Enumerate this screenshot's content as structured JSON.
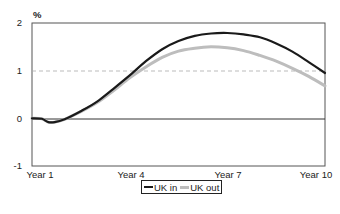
{
  "chart_data": {
    "type": "line",
    "title": "",
    "ylabel": "%",
    "xlabel": "",
    "ylim": [
      -1,
      2
    ],
    "yticks": [
      -1,
      0,
      1,
      2
    ],
    "x": [
      "Year 1",
      "Year 2",
      "Year 3",
      "Year 4",
      "Year 5",
      "Year 6",
      "Year 7",
      "Year 8",
      "Year 9",
      "Year 10"
    ],
    "xtick_labels": [
      "Year 1",
      "Year 4",
      "Year 7",
      "Year 10"
    ],
    "grid": {
      "dashed_reference_line_at": 1,
      "solid_zero_line": true
    },
    "legend_position": "bottom-center",
    "series": [
      {
        "name": "UK in",
        "color": "#1a1a1a",
        "width": 2.2,
        "values": [
          0.0,
          -0.02,
          0.35,
          0.9,
          1.45,
          1.73,
          1.79,
          1.7,
          1.4,
          0.95
        ]
      },
      {
        "name": "UK out",
        "color": "#bdbdbd",
        "width": 3.0,
        "values": [
          0.0,
          -0.02,
          0.33,
          0.85,
          1.28,
          1.47,
          1.48,
          1.32,
          1.05,
          0.68
        ]
      }
    ],
    "dense_curves": {
      "UK in": [
        [
          1,
          0
        ],
        [
          1.3,
          -0.01
        ],
        [
          1.5,
          -0.08
        ],
        [
          1.7,
          -0.08
        ],
        [
          2,
          -0.02
        ],
        [
          2.5,
          0.15
        ],
        [
          3,
          0.35
        ],
        [
          3.5,
          0.62
        ],
        [
          4,
          0.9
        ],
        [
          4.5,
          1.2
        ],
        [
          5,
          1.45
        ],
        [
          5.5,
          1.62
        ],
        [
          6,
          1.73
        ],
        [
          6.5,
          1.78
        ],
        [
          7,
          1.79
        ],
        [
          7.5,
          1.76
        ],
        [
          8,
          1.7
        ],
        [
          8.5,
          1.57
        ],
        [
          9,
          1.4
        ],
        [
          9.5,
          1.18
        ],
        [
          10,
          0.95
        ]
      ],
      "UK out": [
        [
          1,
          0
        ],
        [
          1.3,
          -0.01
        ],
        [
          1.5,
          -0.08
        ],
        [
          1.7,
          -0.08
        ],
        [
          2,
          -0.02
        ],
        [
          2.5,
          0.14
        ],
        [
          3,
          0.33
        ],
        [
          3.5,
          0.58
        ],
        [
          4,
          0.85
        ],
        [
          4.5,
          1.08
        ],
        [
          5,
          1.28
        ],
        [
          5.5,
          1.41
        ],
        [
          6,
          1.47
        ],
        [
          6.5,
          1.5
        ],
        [
          7,
          1.48
        ],
        [
          7.5,
          1.42
        ],
        [
          8,
          1.32
        ],
        [
          8.5,
          1.2
        ],
        [
          9,
          1.05
        ],
        [
          9.5,
          0.88
        ],
        [
          10,
          0.68
        ]
      ]
    }
  },
  "axis": {
    "y_unit": "%",
    "y_labels": [
      "2",
      "1",
      "0",
      "-1"
    ],
    "x_labels": [
      "Year 1",
      "Year 4",
      "Year 7",
      "Year 10"
    ]
  },
  "legend": {
    "items": [
      {
        "label": "UK in",
        "color": "#1a1a1a"
      },
      {
        "label": "UK out",
        "color": "#bdbdbd"
      }
    ]
  }
}
